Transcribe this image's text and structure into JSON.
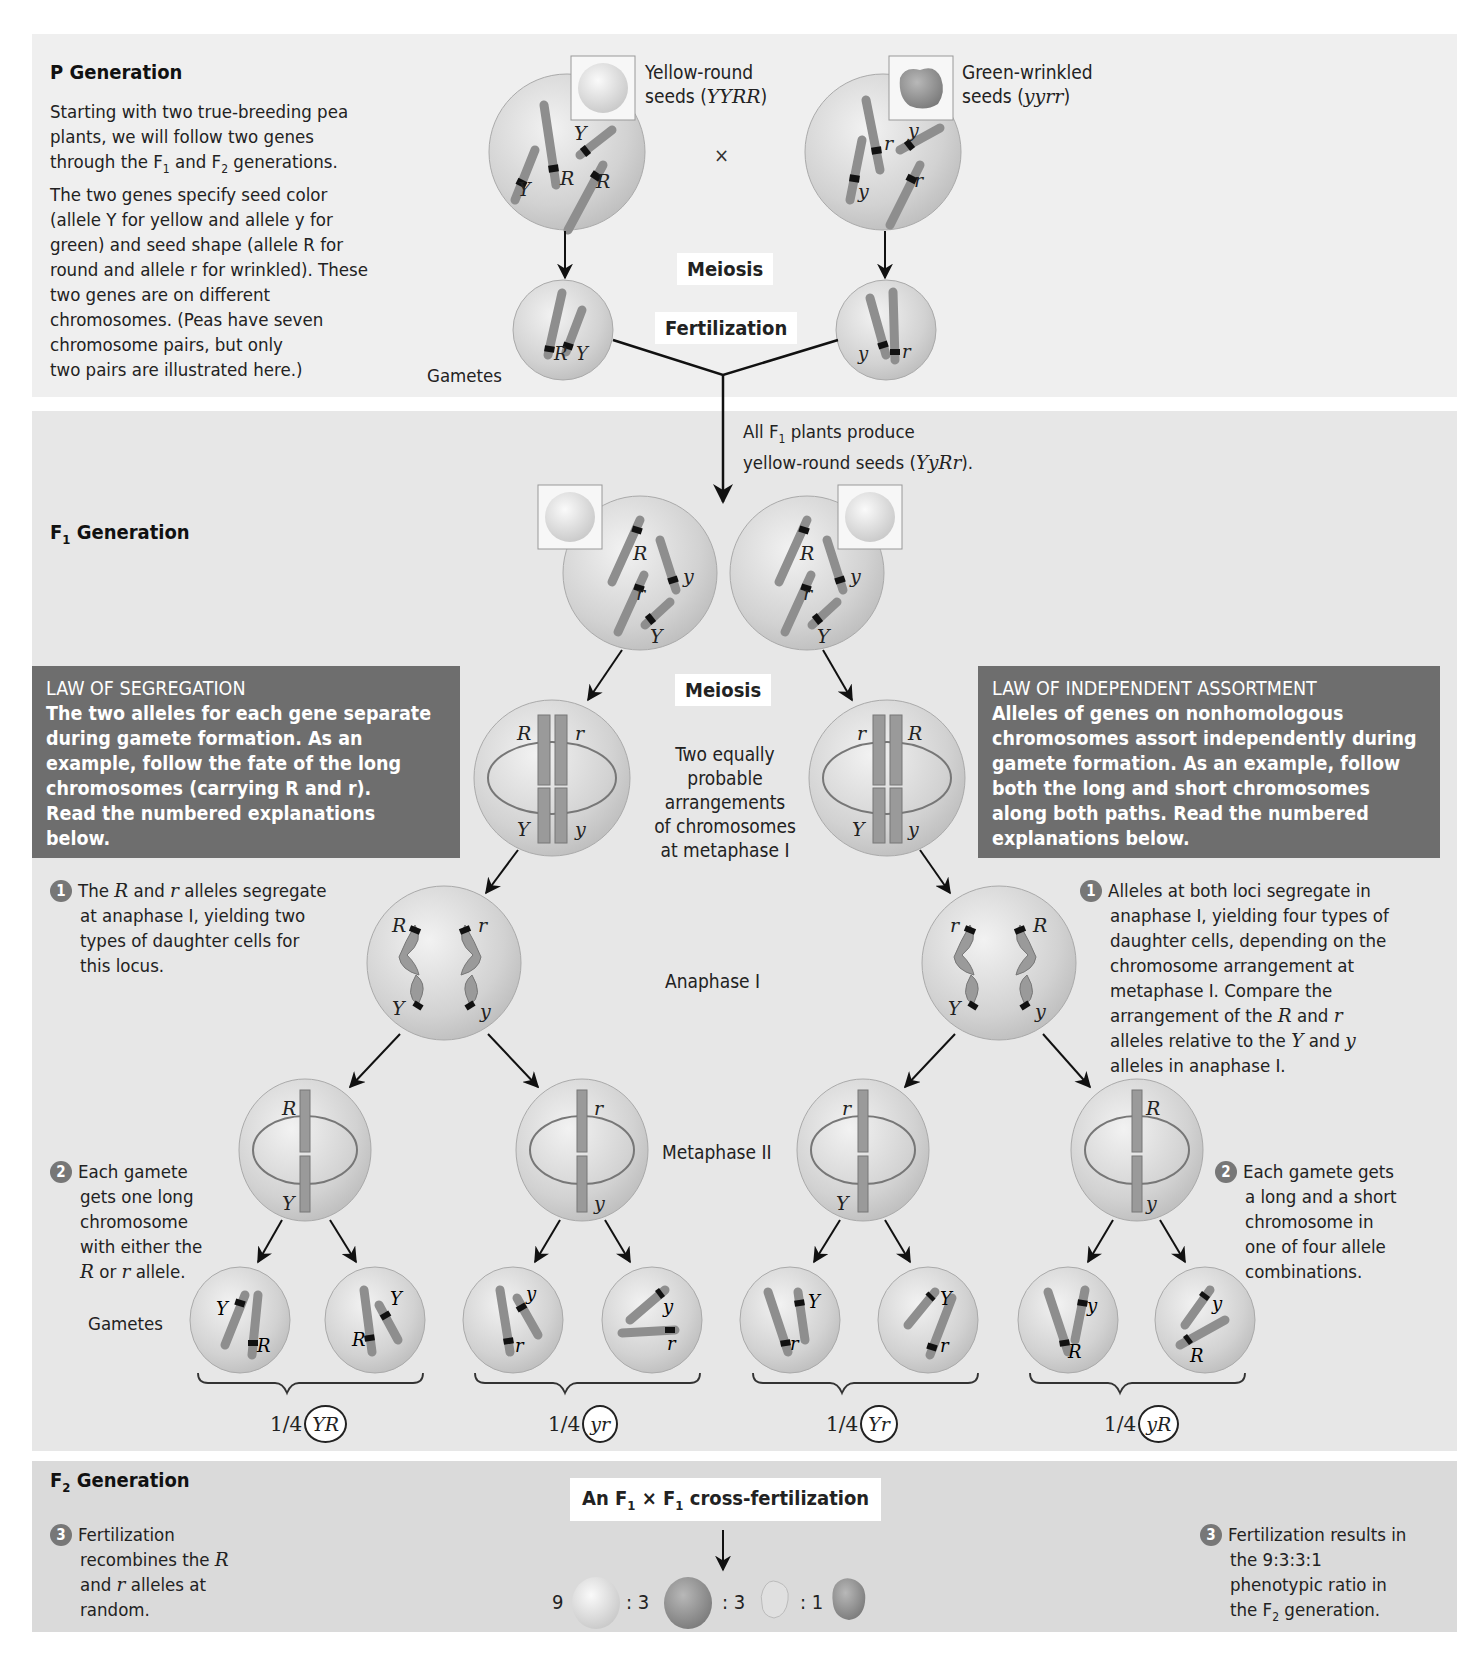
{
  "p_generation": {
    "title": "P Generation",
    "description_lines": [
      "Starting with two true-breeding pea",
      "plants, we will follow two genes",
      "through the F1 and F2 generations.",
      "The two genes specify seed color",
      "(allele Y for yellow and allele y for",
      "green) and seed shape (allele R for",
      "round and allele r for wrinkled). These",
      "two genes are on different",
      "chromosomes. (Peas have seven",
      "chromosome pairs, but only",
      "two pairs are illustrated here.)"
    ],
    "parent1": {
      "label_line1": "Yellow-round",
      "label_line2": "seeds (",
      "genotype": "YYRR",
      "close": ")",
      "alleles": [
        "Y",
        "Y",
        "R",
        "R"
      ],
      "gamete": [
        "R",
        "Y"
      ]
    },
    "parent2": {
      "label_line1": "Green-wrinkled",
      "label_line2": "seeds (",
      "genotype": "yyrr",
      "close": ")",
      "alleles": [
        "y",
        "y",
        "r",
        "r"
      ],
      "gamete": [
        "y",
        "r"
      ]
    },
    "cross_symbol": "×",
    "meiosis_label": "Meiosis",
    "fertilization_label": "Fertilization",
    "gametes_label": "Gametes"
  },
  "f1_generation": {
    "title_prefix": "F",
    "title_sub": "1",
    "title_suffix": " Generation",
    "note_line1_prefix": "All F",
    "note_line1_sub": "1",
    "note_line1_suffix": " plants produce",
    "note_line2_prefix": "yellow-round seeds (",
    "note_line2_genotype": "YyRr",
    "note_line2_suffix": ").",
    "meiosis_label": "Meiosis",
    "metaphase1_label": "Two equally probable arrangements of chromosomes at metaphase I",
    "metaphase1_lines": [
      "Two equally",
      "probable",
      "arrangements",
      "of chromosomes",
      "at metaphase I"
    ],
    "anaphase1_label": "Anaphase I",
    "metaphase2_label": "Metaphase II",
    "gametes_label": "Gametes",
    "law_segregation": {
      "title": "LAW OF SEGREGATION",
      "body_lines": [
        "The two alleles for each gene separate",
        "during gamete formation. As an",
        "example, follow the fate of the long",
        "chromosomes (carrying R and r).",
        "Read the numbered explanations",
        "below."
      ]
    },
    "law_independent": {
      "title": "LAW OF INDEPENDENT ASSORTMENT",
      "body_lines": [
        "Alleles of genes on nonhomologous",
        "chromosomes assort independently during",
        "gamete formation. As an example, follow",
        "both the long and short chromosomes",
        "along both paths. Read the numbered",
        "explanations below."
      ]
    },
    "left_steps": [
      {
        "number": "1",
        "lines": [
          "The R and r alleles segregate",
          "at anaphase I, yielding two",
          "types of daughter cells for",
          "this locus."
        ]
      },
      {
        "number": "2",
        "lines": [
          "Each gamete",
          "gets one long",
          "chromosome",
          "with either the",
          "R or r allele."
        ]
      }
    ],
    "right_steps": [
      {
        "number": "1",
        "lines": [
          "Alleles at both loci segregate in",
          "anaphase I, yielding four types of",
          "daughter cells, depending on the",
          "chromosome arrangement at",
          "metaphase I. Compare the",
          "arrangement of the R and r",
          "alleles relative to the Y and y",
          "alleles in anaphase I."
        ]
      },
      {
        "number": "2",
        "lines": [
          "Each gamete gets",
          "a long and a short",
          "chromosome in",
          "one of four allele",
          "combinations."
        ]
      }
    ],
    "metaphase1_cells": [
      {
        "top_left": "R",
        "top_right": "r",
        "bottom_left": "Y",
        "bottom_right": "y"
      },
      {
        "top_left": "r",
        "top_right": "R",
        "bottom_left": "Y",
        "bottom_right": "y"
      }
    ],
    "metaphase2_cells": [
      {
        "top": "R",
        "bottom": "Y"
      },
      {
        "top": "r",
        "bottom": "y"
      },
      {
        "top": "r",
        "bottom": "Y"
      },
      {
        "top": "R",
        "bottom": "y"
      }
    ],
    "gamete_cells": [
      [
        "Y",
        "R"
      ],
      [
        "Y",
        "R"
      ],
      [
        "y",
        "r"
      ],
      [
        "y",
        "r"
      ],
      [
        "Y",
        "r"
      ],
      [
        "Y",
        "r"
      ],
      [
        "y",
        "R"
      ],
      [
        "y",
        "R"
      ]
    ],
    "gamete_fractions": [
      {
        "fraction": "1/4",
        "genotype": "YR"
      },
      {
        "fraction": "1/4",
        "genotype": "yr"
      },
      {
        "fraction": "1/4",
        "genotype": "Yr"
      },
      {
        "fraction": "1/4",
        "genotype": "yR"
      }
    ]
  },
  "f2_generation": {
    "title_prefix": "F",
    "title_sub": "2",
    "title_suffix": " Generation",
    "cross_label_prefix": "An F",
    "cross_label_sub1": "1",
    "cross_label_mid": " × F",
    "cross_label_sub2": "1",
    "cross_label_suffix": " cross-fertilization",
    "left_step": {
      "number": "3",
      "lines": [
        "Fertilization",
        "recombines the R",
        "and r alleles at",
        "random."
      ]
    },
    "right_step": {
      "number": "3",
      "lines": [
        "Fertilization results in",
        "the 9:3:3:1",
        "phenotypic ratio in",
        "the F2 generation."
      ]
    },
    "ratio": [
      {
        "count": "9",
        "phenotype": "yellow-round"
      },
      {
        "count": ": 3",
        "phenotype": "green-round"
      },
      {
        "count": ": 3",
        "phenotype": "yellow-wrinkled"
      },
      {
        "count": ": 1",
        "phenotype": "green-wrinkled"
      }
    ]
  },
  "colors": {
    "p_panel": "#efefef",
    "f1_panel": "#e7e7e7",
    "f2_panel": "#dadada",
    "law_box": "#6e6e6e",
    "cell_fill": "#d0d0d0",
    "chromosome": "#9a9a9a"
  }
}
